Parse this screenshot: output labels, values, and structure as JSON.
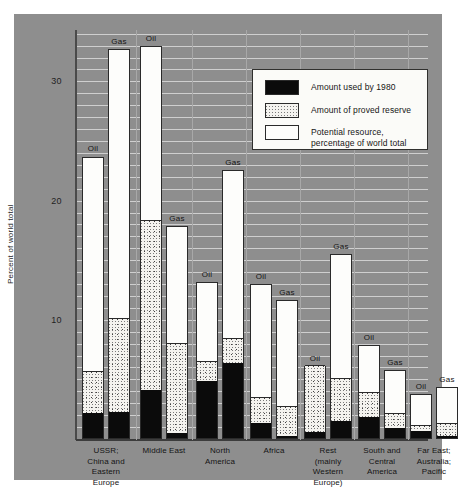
{
  "figure": {
    "ylabel": "Percent of world total",
    "y_ticks": [
      "30",
      "20",
      "10"
    ]
  },
  "legend": {
    "items": [
      {
        "key": "used",
        "label": "Amount used by 1980"
      },
      {
        "key": "reserve",
        "label": "Amount of proved reserve"
      },
      {
        "key": "potential",
        "label": "Potential resource,\npercentage of world total"
      }
    ]
  },
  "chart_data": {
    "type": "bar",
    "title": "",
    "subtitle": "",
    "xlabel": "",
    "ylabel": "Percent of world total",
    "ylim": [
      0,
      34
    ],
    "y_ticks": [
      10,
      20,
      30
    ],
    "grid": true,
    "legend_position": "upper-right",
    "stacked": true,
    "stack_order": [
      "used",
      "reserve",
      "potential"
    ],
    "stack_labels": {
      "used": "Amount used by 1980",
      "reserve": "Amount of proved reserve",
      "potential": "Potential resource, percentage of world total"
    },
    "colors": {
      "used": "#0b0b0b",
      "reserve": "#f0efe9",
      "potential": "#fdfdfb",
      "background": "#8e8e8e",
      "gridline": "#cfcfcf",
      "axis": "#3c3c3c"
    },
    "categories": [
      "USSR;\nChina and\nEastern\nEurope",
      "Middle East",
      "North\nAmerica",
      "Africa",
      "Rest\n(mainly\nWestern\nEurope)",
      "South and\nCentral\nAmerica",
      "Far East;\nAustralia;\nPacific"
    ],
    "bars": [
      {
        "group": "USSR; China and Eastern Europe",
        "fuel": "Oil",
        "used": 2.1,
        "reserve": 3.5,
        "potential": 18.1,
        "total": 23.7
      },
      {
        "group": "USSR; China and Eastern Europe",
        "fuel": "Gas",
        "used": 2.2,
        "reserve": 7.9,
        "potential": 22.6,
        "total": 32.7
      },
      {
        "group": "Middle East",
        "fuel": "Oil",
        "used": 4.0,
        "reserve": 14.3,
        "potential": 14.7,
        "total": 33.0
      },
      {
        "group": "Middle East",
        "fuel": "Gas",
        "used": 0.4,
        "reserve": 7.6,
        "potential": 9.9,
        "total": 17.9
      },
      {
        "group": "North America",
        "fuel": "Oil",
        "used": 4.8,
        "reserve": 1.7,
        "potential": 6.7,
        "total": 13.2
      },
      {
        "group": "North America",
        "fuel": "Gas",
        "used": 6.3,
        "reserve": 2.1,
        "potential": 14.2,
        "total": 22.6
      },
      {
        "group": "Africa",
        "fuel": "Oil",
        "used": 1.3,
        "reserve": 2.1,
        "potential": 9.6,
        "total": 13.0
      },
      {
        "group": "Africa",
        "fuel": "Gas",
        "used": 0.2,
        "reserve": 2.5,
        "potential": 9.0,
        "total": 11.7
      },
      {
        "group": "Rest (mainly Western Europe)",
        "fuel": "Oil",
        "used": 0.5,
        "reserve": 5.6,
        "potential": 0.0,
        "total": 6.1
      },
      {
        "group": "Rest (mainly Western Europe)",
        "fuel": "Gas",
        "used": 1.4,
        "reserve": 3.6,
        "potential": 10.5,
        "total": 15.5
      },
      {
        "group": "South and Central America",
        "fuel": "Oil",
        "used": 1.8,
        "reserve": 2.1,
        "potential": 4.0,
        "total": 7.9
      },
      {
        "group": "South and Central America",
        "fuel": "Gas",
        "used": 0.8,
        "reserve": 1.3,
        "potential": 3.7,
        "total": 5.8
      },
      {
        "group": "Far East; Australia; Pacific",
        "fuel": "Oil",
        "used": 0.6,
        "reserve": 0.5,
        "potential": 2.7,
        "total": 3.8
      },
      {
        "group": "Far East; Australia; Pacific",
        "fuel": "Gas",
        "used": 0.2,
        "reserve": 1.1,
        "potential": 3.1,
        "total": 4.4
      }
    ]
  }
}
